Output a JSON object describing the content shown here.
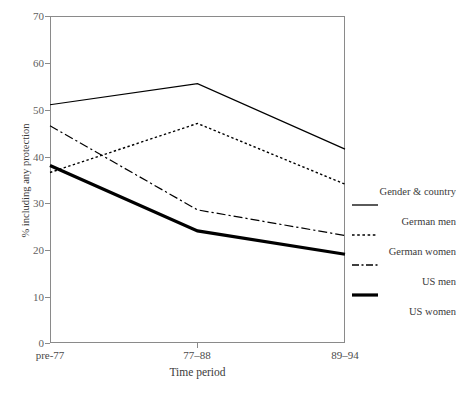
{
  "chart_data": {
    "type": "line",
    "title": "",
    "xlabel": "Time period",
    "ylabel": "% including any protection",
    "categories": [
      "pre-77",
      "77–88",
      "89–94"
    ],
    "x_positions": [
      0,
      1,
      2
    ],
    "ylim": [
      0,
      70
    ],
    "yticks": [
      0,
      10,
      20,
      30,
      40,
      50,
      60,
      70
    ],
    "ytick_labels": [
      "0",
      "10",
      "20",
      "30",
      "40",
      "50",
      "60",
      "70"
    ],
    "grid": false,
    "legend_position": "right",
    "legend_title": "Gender & country",
    "series": [
      {
        "name": "German men",
        "style": "solid-thin",
        "color": "#000000",
        "width": 1.2,
        "values": [
          51,
          55.5,
          41.5
        ]
      },
      {
        "name": "German women",
        "style": "dotted",
        "color": "#000000",
        "width": 1.4,
        "values": [
          36.5,
          47,
          34
        ]
      },
      {
        "name": "US men",
        "style": "dash-dot",
        "color": "#000000",
        "width": 1.2,
        "values": [
          46.5,
          28.5,
          23
        ]
      },
      {
        "name": "US women",
        "style": "solid-thick",
        "color": "#000000",
        "width": 3.2,
        "values": [
          38,
          24,
          19
        ]
      }
    ]
  },
  "axes": {
    "x_label": "Time period",
    "y_label": "% including any protection",
    "x_categories": [
      "pre-77",
      "77–88",
      "89–94"
    ],
    "y_tick_labels": [
      "70",
      "60",
      "50",
      "40",
      "30",
      "20",
      "10",
      "0"
    ]
  },
  "legend": {
    "title": "Gender & country",
    "entries": [
      {
        "label": "German men",
        "style": "solid-thin"
      },
      {
        "label": "German women",
        "style": "dotted"
      },
      {
        "label": "US men",
        "style": "dash-dot"
      },
      {
        "label": "US women",
        "style": "solid-thick"
      }
    ]
  },
  "colors": {
    "line": "#000000",
    "frame": "#8a8a8a",
    "tick_text": "#5f5f5f",
    "label_text": "#3a3a3a",
    "background": "#ffffff"
  }
}
